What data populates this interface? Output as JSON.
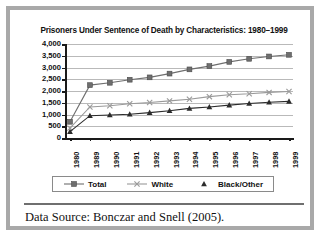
{
  "figure": {
    "caption": "Data Source: Bonczar and Snell (2005)."
  },
  "chart_data": {
    "type": "line",
    "title": "Prisoners Under Sentence of Death by Characteristics: 1980–1999",
    "xlabel": "",
    "ylabel": "",
    "categories": [
      "1980",
      "1989",
      "1990",
      "1991",
      "1992",
      "1993",
      "1994",
      "1995",
      "1996",
      "1997",
      "1998",
      "1999"
    ],
    "ylim": [
      0,
      4000
    ],
    "yticks": [
      "0",
      "500",
      "1,000",
      "1,500",
      "2,000",
      "2,500",
      "3,000",
      "3,500",
      "4,000"
    ],
    "ytick_values": [
      0,
      500,
      1000,
      1500,
      2000,
      2500,
      3000,
      3500,
      4000
    ],
    "grid": true,
    "legend_position": "bottom",
    "series": [
      {
        "name": "Total",
        "marker": "square",
        "color": "#6e6e6e",
        "values": [
          690,
          2250,
          2350,
          2480,
          2580,
          2740,
          2920,
          3060,
          3240,
          3370,
          3470,
          3540
        ]
      },
      {
        "name": "White",
        "marker": "x",
        "color": "#9a9a9a",
        "values": [
          420,
          1320,
          1370,
          1460,
          1510,
          1580,
          1650,
          1760,
          1840,
          1880,
          1940,
          1980
        ]
      },
      {
        "name": "Black/Other",
        "marker": "triangle",
        "color": "#2b2b2b",
        "values": [
          270,
          950,
          980,
          1010,
          1080,
          1160,
          1260,
          1320,
          1400,
          1470,
          1520,
          1560
        ]
      }
    ]
  }
}
